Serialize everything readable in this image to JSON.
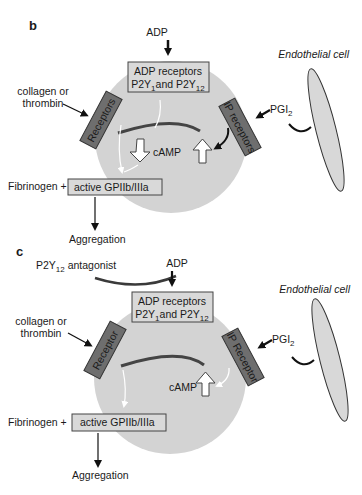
{
  "panels": [
    {
      "label": "b",
      "ligand_top": "ADP",
      "adp_box": {
        "line1": "ADP  receptors",
        "line2_a": "P2Y",
        "line2_sub1": "1",
        "line2_b": "and P2Y",
        "line2_sub2": "12"
      },
      "left_input": {
        "line1": "collagen or",
        "line2": "thrombin"
      },
      "left_receptor": "Receptors",
      "right_receptor": "IP receptors",
      "pgi": "PGI",
      "pgi_sub": "2",
      "endothelial": "Endothelial cell",
      "camp": "cAMP",
      "fibrinogen": "Fibrinogen +",
      "gp_box": "active GPIIb/IIIa",
      "output": "Aggregation"
    },
    {
      "label": "c",
      "antagonist": "P2Y",
      "antagonist_sub": "12",
      "antagonist_rest": " antagonist",
      "ligand_top": "ADP",
      "adp_box": {
        "line1": "ADP  receptors",
        "line2_a": "P2Y",
        "line2_sub1": "1",
        "line2_b": "and P2Y",
        "line2_sub2": "12"
      },
      "left_input": {
        "line1": "collagen or",
        "line2": "thrombin"
      },
      "left_receptor": "Receptor",
      "right_receptor": "IP Receptor",
      "pgi": "PGI",
      "pgi_sub": "2",
      "endothelial": "Endothelial cell",
      "camp": "cAMP",
      "fibrinogen": "Fibrinogen +",
      "gp_box": "active GPIIb/IIIa",
      "output": "Aggregation"
    }
  ],
  "colors": {
    "platelet": "#d3d3d3",
    "receptor_dark": "#6e6e6e",
    "box_fill": "#d9d9d9",
    "inhibitor_line": "#3a3a3a"
  }
}
